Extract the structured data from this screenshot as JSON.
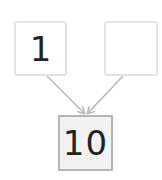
{
  "diagram": {
    "top_left": {
      "value": "1"
    },
    "top_right": {
      "value": ""
    },
    "bottom": {
      "value": "10"
    },
    "colors": {
      "arrow": "#b8b8b8",
      "box_border": "#e3e3e3",
      "sum_border": "#b5b5b5",
      "sum_fill": "#f2f2f2"
    }
  }
}
